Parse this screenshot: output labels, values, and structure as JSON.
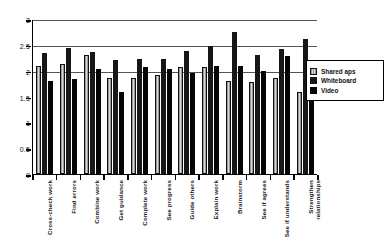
{
  "chart_data": {
    "type": "bar",
    "title": "",
    "subtitle": "",
    "xlabel": "",
    "ylabel": "",
    "ylim": [
      0,
      3
    ],
    "yticks": [
      "0",
      "0.5",
      "1",
      "1.5",
      "2",
      "2.5",
      "3"
    ],
    "ytick_values": [
      0,
      0.5,
      1,
      1.5,
      2,
      2.5,
      3
    ],
    "gridlines": [
      2,
      2.5,
      3
    ],
    "grid": true,
    "legend_position": "right",
    "categories": [
      "Cross-check  work",
      "Find  errors",
      "Combine work",
      "Get guidance",
      "Complete work",
      "See progress",
      "Guide others",
      "Explain  work",
      "Brainstorm",
      "See if agrees",
      "See if understands",
      "Strengthen relationships"
    ],
    "series": [
      {
        "name": "Shared aps",
        "values": [
          2.1,
          2.12,
          2.31,
          1.86,
          1.85,
          1.92,
          2.07,
          2.07,
          1.8,
          1.79,
          1.86,
          1.58
        ]
      },
      {
        "name": "Whiteboard",
        "values": [
          2.34,
          2.44,
          2.37,
          2.21,
          2.22,
          2.23,
          2.38,
          2.48,
          2.75,
          2.3,
          2.41,
          2.62
        ]
      },
      {
        "name": "Video",
        "values": [
          1.8,
          1.84,
          2.03,
          1.59,
          2.08,
          2.04,
          1.96,
          2.09,
          2.09,
          1.99,
          2.29,
          2.07
        ]
      }
    ]
  },
  "legend": {
    "items": [
      {
        "label": "Shared aps"
      },
      {
        "label": "Whiteboard"
      },
      {
        "label": "Video"
      }
    ]
  }
}
